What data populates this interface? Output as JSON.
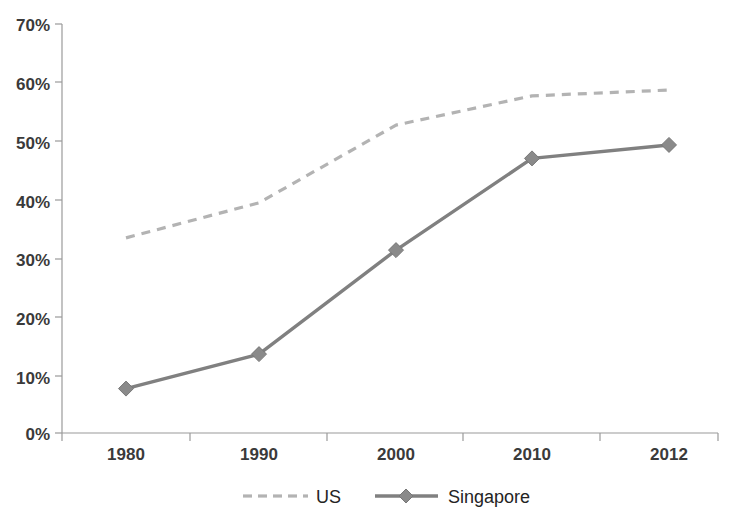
{
  "chart_data": {
    "type": "line",
    "title": "",
    "subtitle": "",
    "xlabel": "",
    "ylabel": "",
    "categories": [
      "1980",
      "1990",
      "2000",
      "2010",
      "2012"
    ],
    "series": [
      {
        "name": "US",
        "values": [
          33.4,
          39.4,
          52.7,
          57.7,
          58.7
        ],
        "color": "#b3b3b3",
        "style": "dashed",
        "marker": "none"
      },
      {
        "name": "Singapore",
        "values": [
          7.6,
          13.5,
          31.3,
          47.0,
          49.3
        ],
        "color": "#808080",
        "style": "solid",
        "marker": "diamond"
      }
    ],
    "ylim": [
      0,
      70
    ],
    "ytick_values": [
      0,
      10,
      20,
      30,
      40,
      50,
      60,
      70
    ],
    "ytick_labels": [
      "0%",
      "10%",
      "20%",
      "30%",
      "40%",
      "50%",
      "60%",
      "70%"
    ],
    "xtick_labels": [
      "1980",
      "1990",
      "2000",
      "2010",
      "2012"
    ],
    "grid": false,
    "legend_position": "bottom",
    "legend_entries": [
      "US",
      "Singapore"
    ],
    "background_color": "#ffffff",
    "axis_color": "#9a9a9a"
  },
  "legend": {
    "us_label": "US",
    "singapore_label": "Singapore"
  },
  "axes": {
    "y_labels": [
      "70%",
      "60%",
      "50%",
      "40%",
      "30%",
      "20%",
      "10%",
      "0%"
    ],
    "x_labels": [
      "1980",
      "1990",
      "2000",
      "2010",
      "2012"
    ]
  }
}
